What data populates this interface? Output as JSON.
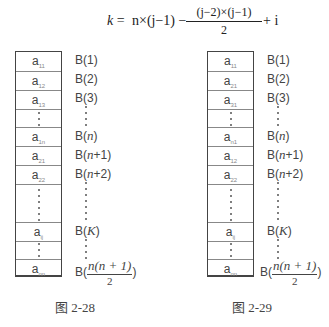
{
  "formula": {
    "lhs": "k",
    "eq": " = ",
    "term1": "n×(j−1) −",
    "frac_num": "(j−2)×(j−1)",
    "frac_den": "2",
    "tail": "+ i"
  },
  "figures": [
    {
      "caption": "图 2-28",
      "cells": [
        {
          "base": "a",
          "sub": "11"
        },
        {
          "base": "a",
          "sub": "12"
        },
        {
          "base": "a",
          "sub": "13"
        },
        {
          "dots": true
        },
        {
          "base": "a",
          "sub": "1n"
        },
        {
          "base": "a",
          "sub": "21"
        },
        {
          "base": "a",
          "sub": "22"
        },
        {
          "dots": true
        },
        {
          "base": "a",
          "sub": "ij"
        },
        {
          "dots": true
        },
        {
          "base": "a",
          "sub": "nn"
        }
      ],
      "labels": [
        "B(1)",
        "B(2)",
        "B(3)",
        "B(n)",
        "B(n+1)",
        "B(n+2)",
        "B(K)",
        "B(n(n+1)/2)"
      ]
    },
    {
      "caption": "图 2-29",
      "cells": [
        {
          "base": "a",
          "sub": "11"
        },
        {
          "base": "a",
          "sub": "21"
        },
        {
          "base": "a",
          "sub": "31"
        },
        {
          "dots": true
        },
        {
          "base": "a",
          "sub": "n1"
        },
        {
          "base": "a",
          "sub": "12"
        },
        {
          "base": "a",
          "sub": "22"
        },
        {
          "dots": true
        },
        {
          "base": "a",
          "sub": "ij"
        },
        {
          "dots": true
        },
        {
          "base": "a",
          "sub": "nn"
        }
      ],
      "labels": [
        "B(1)",
        "B(2)",
        "B(3)",
        "B(n)",
        "B(n+1)",
        "B(n+2)",
        "B(K)",
        "B(n(n+1)/2)"
      ]
    }
  ],
  "label_parts": {
    "b_open": "B(",
    "b_close": ")",
    "one": "1",
    "two": "2",
    "three": "3",
    "n": "n",
    "plus1": "+1",
    "plus2": "+2",
    "K": "K",
    "frac_num": "n(n + 1)",
    "frac_den": "2"
  }
}
